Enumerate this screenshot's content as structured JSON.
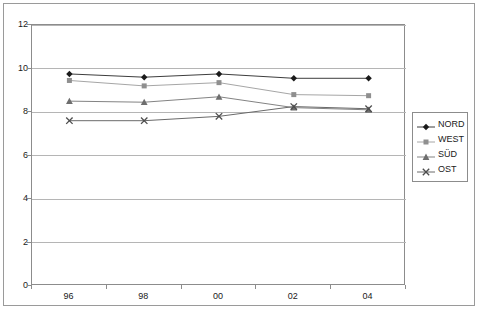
{
  "chart_data": {
    "type": "line",
    "title": "",
    "subtitle": "",
    "xlabel": "",
    "ylabel": "",
    "categories": [
      "96",
      "98",
      "00",
      "02",
      "04"
    ],
    "ylim": [
      0,
      12
    ],
    "yticks": [
      0,
      2,
      4,
      6,
      8,
      10,
      12
    ],
    "ytick_labels": [
      "0",
      "2",
      "4",
      "6",
      "8",
      "10",
      "12"
    ],
    "grid": "horizontal",
    "legend_position": "right",
    "series": [
      {
        "name": "NORD",
        "marker": "diamond",
        "color": "#1a1a1a",
        "line_color": "#3d3d3d",
        "values": [
          9.75,
          9.6,
          9.75,
          9.55,
          9.55
        ]
      },
      {
        "name": "WEST",
        "marker": "square",
        "color": "#8f8f8f",
        "line_color": "#a6a6a6",
        "values": [
          9.45,
          9.2,
          9.35,
          8.8,
          8.75
        ]
      },
      {
        "name": "SÜD",
        "marker": "triangle",
        "color": "#6e6e6e",
        "line_color": "#838383",
        "values": [
          8.5,
          8.45,
          8.7,
          8.2,
          8.1
        ]
      },
      {
        "name": "OST",
        "marker": "cross",
        "color": "#4d4d4d",
        "line_color": "#6a6a6a",
        "values": [
          7.6,
          7.6,
          7.8,
          8.25,
          8.15
        ]
      }
    ]
  },
  "legend": {
    "items": [
      {
        "label": "NORD"
      },
      {
        "label": "WEST"
      },
      {
        "label": "SÜD"
      },
      {
        "label": "OST"
      }
    ]
  },
  "axes": {
    "y_labels": [
      "12",
      "10",
      "8",
      "6",
      "4",
      "2",
      "0"
    ],
    "x_labels": [
      "96",
      "98",
      "00",
      "02",
      "04"
    ]
  },
  "colors": {
    "plot_border": "#8c8c8c",
    "outer_border": "#9a9a9a",
    "gridline": "#b5b5b5",
    "text": "#1a1a1a",
    "background": "#ffffff"
  }
}
